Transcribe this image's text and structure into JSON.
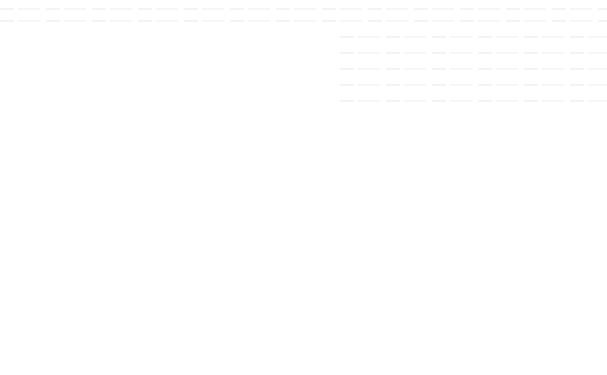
{
  "caption": "Figure 6",
  "colors": {
    "stroke": "#1a1a1a",
    "background": "#ffffff"
  },
  "top_network": {
    "input_layer": {
      "label": "INPUT LAYER",
      "nodes": [
        {
          "base": "x",
          "sub": "1",
          "cx": 80,
          "cy": 60
        },
        {
          "base": "x",
          "sub": "2",
          "cx": 80,
          "cy": 97
        },
        {
          "base": "x",
          "sub": "n",
          "cx": 80,
          "cy": 134
        }
      ],
      "label_pos": {
        "x": 80,
        "y": 158
      }
    },
    "pattern_layer": {
      "label": "PATTERN LAYER",
      "nodes": [
        {
          "base": "h",
          "sub": "1",
          "cx": 184,
          "cy": 38
        },
        {
          "base": "h",
          "sub": "2",
          "cx": 184,
          "cy": 77
        },
        {
          "base": "h",
          "sub": "3",
          "cx": 184,
          "cy": 114
        },
        {
          "base": "h",
          "sub": "n",
          "cx": 184,
          "cy": 152
        }
      ],
      "label_pos": {
        "x": 184,
        "y": 178
      }
    },
    "summation_layer": {
      "label": "SUMMATION LAYER",
      "nodes": [
        {
          "base": "y",
          "sub": "1",
          "cx": 284,
          "cy": 59
        },
        {
          "base": "y",
          "sub": "2",
          "cx": 284,
          "cy": 96
        },
        {
          "base": "y",
          "sub": "3",
          "cx": 284,
          "cy": 130
        }
      ],
      "label_pos": {
        "x": 290,
        "y": 156
      }
    }
  },
  "bottom_network": {
    "input_layer": {
      "label": "INPUT LAYER",
      "nodes": [
        {
          "base": "x",
          "sub": "1",
          "cx": 44,
          "cy": 242
        },
        {
          "base": "x",
          "sub": "2",
          "cx": 43,
          "cy": 283
        },
        {
          "base": "x",
          "sub": "n",
          "cx": 44,
          "cy": 326
        }
      ],
      "label_pos": {
        "x": 53,
        "y": 352
      }
    },
    "hidden_layer": {
      "label": "HIDDEN LAYER",
      "nodes": [
        {
          "base": "h",
          "sub": "1",
          "cx": 170,
          "cy": 208
        },
        {
          "base": "h",
          "sub": "2",
          "cx": 170,
          "cy": 246
        },
        {
          "base": "h",
          "sub": "3",
          "cx": 170,
          "cy": 285
        },
        {
          "base": "h",
          "sub": "n",
          "cx": 170,
          "cy": 324
        }
      ],
      "label_pos": {
        "x": 171,
        "y": 352
      }
    },
    "output_layer": {
      "label": "OUTPUT LAYER",
      "nodes": [
        {
          "base": "y",
          "sub": "1",
          "cx": 299,
          "cy": 242
        },
        {
          "base": "y",
          "sub": "2",
          "cx": 299,
          "cy": 282
        },
        {
          "base": "y",
          "sub": "3",
          "cx": 299,
          "cy": 321
        }
      ],
      "label_pos": {
        "x": 300,
        "y": 350
      }
    }
  },
  "ensemble": {
    "input_layer": {
      "label": "INPUT LAYER",
      "nodes": [
        {
          "base": "x",
          "sub": "1",
          "cx": 409,
          "cy": 143
        },
        {
          "base": "x",
          "sub": "2",
          "cx": 409,
          "cy": 182
        },
        {
          "base": "x",
          "sub": "n",
          "cx": 409,
          "cy": 218
        }
      ],
      "label_pos": {
        "x": 410,
        "y": 248
      }
    },
    "weights": [
      {
        "base": "w",
        "sub": "s",
        "x": 455,
        "y": 152
      },
      {
        "base": "w",
        "sub": "1",
        "x": 455,
        "y": 175
      },
      {
        "base": "w",
        "sub": "n",
        "x": 455,
        "y": 193
      }
    ],
    "summation": {
      "symbol": "Σ",
      "label_line1": "SUMMATION",
      "label_line2": "LAYER",
      "cx": 500,
      "cy": 182,
      "label_pos": {
        "x": 500,
        "y": 206
      }
    },
    "output": {
      "symbol": "y",
      "label_line1": "OUTPUT",
      "label_line2": "LAYER",
      "box": {
        "x": 546,
        "y": 167,
        "w": 42,
        "h": 29
      },
      "label_pos": {
        "x": 567,
        "y": 209
      }
    }
  }
}
